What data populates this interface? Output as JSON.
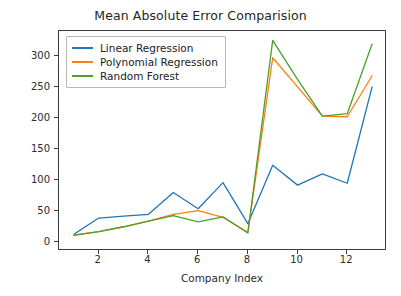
{
  "chart_data": {
    "type": "line",
    "title": "Mean Absolute Error Comparision",
    "xlabel": "Company Index",
    "ylabel": "Error Magnitude",
    "grid": false,
    "legend_position": "upper left",
    "xlim": [
      0.4,
      13.6
    ],
    "ylim": [
      -14,
      340
    ],
    "xticks": [
      2,
      4,
      6,
      8,
      10,
      12
    ],
    "yticks": [
      0,
      50,
      100,
      150,
      200,
      250,
      300
    ],
    "x": [
      1,
      2,
      3,
      4,
      5,
      6,
      7,
      8,
      9,
      10,
      11,
      12,
      13
    ],
    "series": [
      {
        "name": "Linear Regression",
        "color": "#1f77b4",
        "values": [
          13,
          39,
          42,
          45,
          80,
          54,
          96,
          30,
          124,
          92,
          110,
          95,
          250
        ]
      },
      {
        "name": "Polynomial Regression",
        "color": "#ff7f0e",
        "values": [
          12,
          17,
          25,
          34,
          45,
          51,
          40,
          16,
          297,
          250,
          203,
          202,
          268
        ]
      },
      {
        "name": "Random Forest",
        "color": "#4aa02c",
        "values": [
          11,
          17,
          25,
          34,
          43,
          33,
          41,
          15,
          325,
          262,
          203,
          207,
          319
        ]
      }
    ]
  },
  "axes": {
    "frame_color": "#3b3b3b"
  }
}
